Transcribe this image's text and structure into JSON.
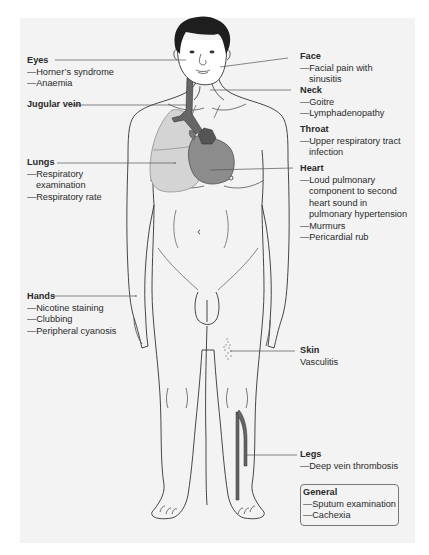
{
  "colors": {
    "panel_bg": "#f3f3f3",
    "outline": "#333333",
    "hair": "#1e1e1e",
    "lung_fill": "#d4d4d4",
    "heart_fill": "#8c8c8c",
    "heart_dark": "#555555",
    "vein_fill": "#666666",
    "leader_line": "#555555"
  },
  "labels": {
    "eyes": {
      "title": "Eyes",
      "items": [
        "—Horner’s syndrome",
        "—Anaemia"
      ]
    },
    "jugular": {
      "title": "Jugular vein"
    },
    "lungs": {
      "title": "Lungs",
      "items": [
        "—Respiratory",
        "examination",
        "—Respiratory rate"
      ]
    },
    "hands": {
      "title": "Hands",
      "items": [
        "—Nicotine staining",
        "—Clubbing",
        "—Peripheral cyanosis"
      ]
    },
    "face": {
      "title": "Face",
      "items": [
        "—Facial pain with",
        "sinusitis"
      ]
    },
    "neck": {
      "title": "Neck",
      "items": [
        "—Goitre",
        "—Lymphadenopathy"
      ]
    },
    "throat": {
      "title": "Throat",
      "items": [
        "—Upper respiratory tract",
        "infection"
      ]
    },
    "heart": {
      "title": "Heart",
      "items": [
        "—Loud pulmonary",
        "component to second",
        "heart sound in",
        "pulmonary hypertension",
        "—Murmurs",
        "—Pericardial rub"
      ]
    },
    "skin": {
      "title": "Skin",
      "items": [
        "Vasculitis"
      ]
    },
    "legs": {
      "title": "Legs",
      "items": [
        "—Deep vein thrombosis"
      ]
    },
    "general": {
      "title": "General",
      "items": [
        "—Sputum examination",
        "—Cachexia"
      ]
    }
  }
}
